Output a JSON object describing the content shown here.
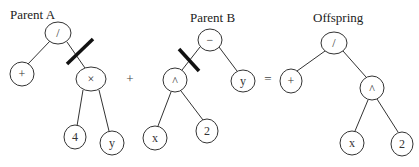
{
  "trees": {
    "parent_a": {
      "label": "Parent A",
      "nodes": {
        "root": "/",
        "left": "+",
        "right": "×",
        "right_left": "4",
        "right_right": "y"
      },
      "cut_edge": "root-right"
    },
    "parent_b": {
      "label": "Parent B",
      "nodes": {
        "root": "−",
        "left": "^",
        "right": "y",
        "left_left": "x",
        "left_right": "2"
      },
      "cut_edge": "root-left"
    },
    "offspring": {
      "label": "Offspring",
      "nodes": {
        "root": "/",
        "left": "+",
        "right": "^",
        "right_left": "x",
        "right_right": "2"
      }
    }
  },
  "operators": {
    "plus": "+",
    "equals": "="
  }
}
